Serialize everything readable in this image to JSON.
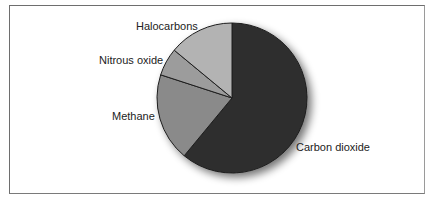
{
  "chart_data": {
    "type": "pie",
    "title": "",
    "start_angle": "12 o'clock, clockwise",
    "categories": [
      "Carbon dioxide",
      "Methane",
      "Nitrous oxide",
      "Halocarbons"
    ],
    "values": [
      61,
      19,
      6,
      14
    ],
    "units": "percent (estimated share)",
    "colors": [
      "#2f2f2f",
      "#8a8a8a",
      "#9c9c9c",
      "#b3b3b3"
    ],
    "legend": "none (direct labels)",
    "labels": {
      "co2": "Carbon dioxide",
      "methane": "Methane",
      "n2o": "Nitrous oxide",
      "halo": "Halocarbons"
    }
  }
}
